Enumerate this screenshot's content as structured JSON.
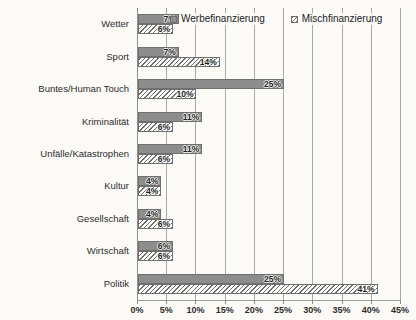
{
  "chart_data": {
    "type": "bar",
    "orientation": "horizontal",
    "title": "",
    "xlabel": "",
    "ylabel": "",
    "xlim": [
      0,
      45
    ],
    "xtick_labels": [
      "0%",
      "5%",
      "10%",
      "15%",
      "20%",
      "25%",
      "30%",
      "35%",
      "40%",
      "45%"
    ],
    "xtick_values": [
      0,
      5,
      10,
      15,
      20,
      25,
      30,
      35,
      40,
      45
    ],
    "grid": true,
    "legend_position": "top",
    "categories": [
      "Wetter",
      "Sport",
      "Buntes/Human Touch",
      "Kriminalität",
      "Unfälle/Katastrophen",
      "Kultur",
      "Gesellschaft",
      "Wirtschaft",
      "Politik"
    ],
    "series": [
      {
        "name": "Werbefinanzierung",
        "values": [
          7,
          7,
          25,
          11,
          11,
          4,
          4,
          6,
          25
        ],
        "labels": [
          "7%",
          "7%",
          "25%",
          "11%",
          "11%",
          "4%",
          "4%",
          "6%",
          "25%"
        ],
        "color": "#8d8d8d",
        "fill": "solid"
      },
      {
        "name": "Mischfinanzierung",
        "values": [
          6,
          14,
          10,
          6,
          6,
          4,
          6,
          6,
          41
        ],
        "labels": [
          "6%",
          "14%",
          "10%",
          "6%",
          "6%",
          "4%",
          "6%",
          "6%",
          "41%"
        ],
        "color": "#fdfdfb",
        "fill": "diagonal-hatch"
      }
    ]
  },
  "legend": {
    "items": [
      {
        "label": "Werbefinanzierung",
        "swatch": "solid-gray-square-icon"
      },
      {
        "label": "Mischfinanzierung",
        "swatch": "hatched-square-icon"
      }
    ]
  }
}
